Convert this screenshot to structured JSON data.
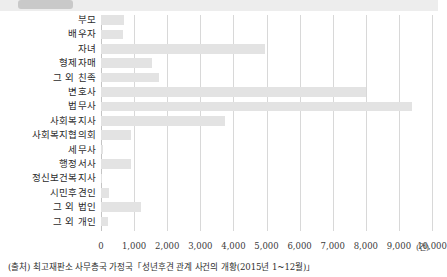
{
  "banner": {
    "tag_label": ""
  },
  "chart_data": {
    "type": "bar",
    "orientation": "horizontal",
    "title": "",
    "xlabel": "",
    "ylabel": "",
    "unit_label": "(건)",
    "xlim": [
      0,
      10000
    ],
    "xticks": [
      0,
      1000,
      2000,
      3000,
      4000,
      5000,
      6000,
      7000,
      8000,
      9000,
      10000
    ],
    "xtick_labels": [
      "0",
      "1,000",
      "2,000",
      "3,000",
      "4,000",
      "5,000",
      "6,000",
      "7,000",
      "8,000",
      "9,000",
      "10,000"
    ],
    "grid": true,
    "legend": "none",
    "bar_color": "#e3e3e3",
    "categories": [
      "부모",
      "배우자",
      "자녀",
      "형제자매",
      "그 외 친족",
      "변호사",
      "법무사",
      "사회복지사",
      "사회복지협의회",
      "세무사",
      "행정서사",
      "정신보건복지사",
      "시민후견인",
      "그 외 법인",
      "그 외 개인"
    ],
    "values": [
      700,
      650,
      4950,
      1550,
      1750,
      8000,
      9400,
      3750,
      900,
      50,
      900,
      30,
      250,
      1200,
      200
    ]
  },
  "source": {
    "text": "(출처) 최고재판소 사무총국 가정국「성년후견 관계 사건의 개황(2015년 1~12월)」"
  }
}
